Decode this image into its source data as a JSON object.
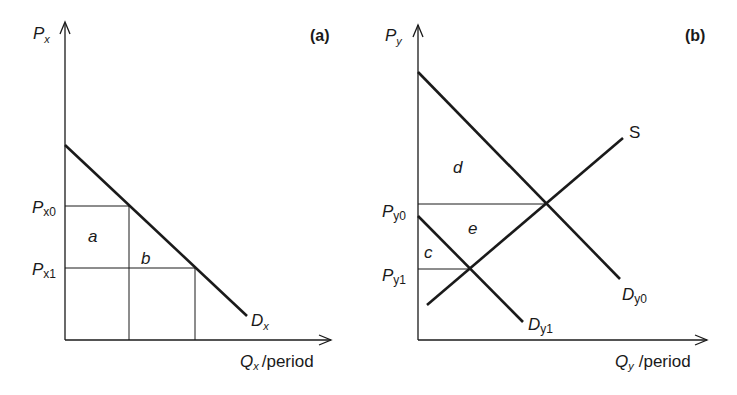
{
  "figure": {
    "panels": [
      {
        "id": "a",
        "panel_label": "(a)",
        "y_axis": {
          "symbol": "P",
          "sub": "x"
        },
        "x_axis": {
          "symbol": "Q",
          "sub": "x",
          "suffix": "/period"
        },
        "price_levels": [
          {
            "symbol": "P",
            "sub": "x0"
          },
          {
            "symbol": "P",
            "sub": "x1"
          }
        ],
        "curves": [
          {
            "symbol": "D",
            "sub": "x",
            "type": "demand"
          }
        ],
        "areas": [
          "a",
          "b"
        ]
      },
      {
        "id": "b",
        "panel_label": "(b)",
        "y_axis": {
          "symbol": "P",
          "sub": "y"
        },
        "x_axis": {
          "symbol": "Q",
          "sub": "y",
          "suffix": "/period"
        },
        "price_levels": [
          {
            "symbol": "P",
            "sub": "y0"
          },
          {
            "symbol": "P",
            "sub": "y1"
          }
        ],
        "curves": [
          {
            "symbol": "S",
            "sub": "",
            "type": "supply"
          },
          {
            "symbol": "D",
            "sub": "y0",
            "type": "demand"
          },
          {
            "symbol": "D",
            "sub": "y1",
            "type": "demand"
          }
        ],
        "areas": [
          "d",
          "e",
          "c"
        ]
      }
    ],
    "colors": {
      "ink": "#1a1a1a",
      "background": "#ffffff"
    }
  }
}
